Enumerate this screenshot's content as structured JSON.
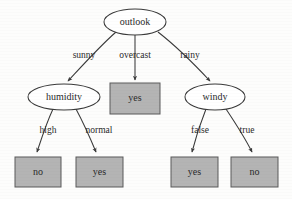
{
  "diagram": {
    "type": "decision-tree",
    "title": "",
    "colors": {
      "leaf_fill": "#b4b4b4",
      "leaf_stroke": "#5a5a5a",
      "node_stroke": "#3a3a3a",
      "node_fill": "#ffffff",
      "edge_stroke": "#3a3a3a",
      "text": "#2a2a2a",
      "background": "#fdfdfc"
    },
    "nodes": [
      {
        "id": "outlook",
        "label": "outlook",
        "shape": "ellipse",
        "cx": 135,
        "cy": 22,
        "rx": 31,
        "ry": 13
      },
      {
        "id": "humidity",
        "label": "humidity",
        "shape": "ellipse",
        "cx": 64,
        "cy": 97,
        "rx": 36,
        "ry": 13
      },
      {
        "id": "yes_over",
        "label": "yes",
        "shape": "box",
        "x": 110,
        "y": 83,
        "w": 50,
        "h": 31
      },
      {
        "id": "windy",
        "label": "windy",
        "shape": "ellipse",
        "cx": 215,
        "cy": 97,
        "rx": 30,
        "ry": 13
      },
      {
        "id": "no_high",
        "label": "no",
        "shape": "box",
        "x": 15,
        "y": 157,
        "w": 46,
        "h": 30
      },
      {
        "id": "yes_norm",
        "label": "yes",
        "shape": "box",
        "x": 76,
        "y": 157,
        "w": 47,
        "h": 30
      },
      {
        "id": "yes_false",
        "label": "yes",
        "shape": "box",
        "x": 171,
        "y": 157,
        "w": 47,
        "h": 30
      },
      {
        "id": "no_true",
        "label": "no",
        "shape": "box",
        "x": 231,
        "y": 157,
        "w": 47,
        "h": 30
      }
    ],
    "edges": [
      {
        "from": "outlook",
        "to": "humidity",
        "label": "sunny",
        "label_x": 84,
        "label_y": 55
      },
      {
        "from": "outlook",
        "to": "yes_over",
        "label": "overcast",
        "label_x": 135,
        "label_y": 55
      },
      {
        "from": "outlook",
        "to": "windy",
        "label": "rainy",
        "label_x": 190,
        "label_y": 55
      },
      {
        "from": "humidity",
        "to": "no_high",
        "label": "high",
        "label_x": 48,
        "label_y": 130
      },
      {
        "from": "humidity",
        "to": "yes_norm",
        "label": "normal",
        "label_x": 99,
        "label_y": 130
      },
      {
        "from": "windy",
        "to": "yes_false",
        "label": "false",
        "label_x": 200,
        "label_y": 130
      },
      {
        "from": "windy",
        "to": "no_true",
        "label": "true",
        "label_x": 247,
        "label_y": 130
      }
    ]
  }
}
